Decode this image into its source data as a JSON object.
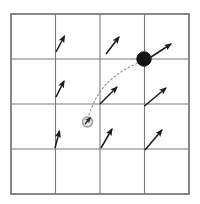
{
  "figure": {
    "background_color": "#ffffff",
    "width": 200,
    "height": 204
  },
  "grid": {
    "name": "4x4-grid",
    "rows": 4,
    "cols": 4,
    "x_lines": [
      11,
      55.5,
      100,
      144.5,
      189
    ],
    "y_lines": [
      14,
      59,
      104,
      149,
      194
    ],
    "line_color": "#7a7a7a",
    "border_color": "#6a6a6a",
    "line_width": 1.1,
    "border_width": 1.6
  },
  "chart_data": {
    "type": "scatter",
    "xlabel": "",
    "ylabel": "",
    "xlim": [
      11,
      189
    ],
    "ylim": [
      14,
      194
    ],
    "grid": true,
    "legend": "none"
  },
  "arrows": {
    "color": "#1a1a1a",
    "stroke_width": 1.5,
    "head_length": 5.2,
    "head_width": 3.4,
    "items": [
      {
        "name": "arrow-r1c2",
        "x1": 56.0,
        "y1": 52.0,
        "x2": 64.5,
        "y2": 36.0
      },
      {
        "name": "arrow-r1c3",
        "x1": 106.0,
        "y1": 54.0,
        "x2": 119.0,
        "y2": 37.0
      },
      {
        "name": "arrow-r1c4",
        "x1": 151.0,
        "y1": 57.0,
        "x2": 171.0,
        "y2": 44.0
      },
      {
        "name": "arrow-r2c2",
        "x1": 56.0,
        "y1": 97.0,
        "x2": 64.0,
        "y2": 81.0
      },
      {
        "name": "arrow-r2c3",
        "x1": 100.0,
        "y1": 104.0,
        "x2": 117.0,
        "y2": 87.0
      },
      {
        "name": "arrow-r2c4",
        "x1": 144.5,
        "y1": 106.0,
        "x2": 166.0,
        "y2": 88.0
      },
      {
        "name": "arrow-r3c2",
        "x1": 55.0,
        "y1": 148.0,
        "x2": 59.5,
        "y2": 131.0
      },
      {
        "name": "arrow-r3c3",
        "x1": 101.0,
        "y1": 148.0,
        "x2": 112.0,
        "y2": 129.0
      },
      {
        "name": "arrow-r3c4",
        "x1": 145.0,
        "y1": 150.0,
        "x2": 162.0,
        "y2": 130.0
      }
    ]
  },
  "trajectory": {
    "name": "dotted-trajectory-path",
    "from": {
      "x": 88.0,
      "y": 119.0
    },
    "to": {
      "x": 141.0,
      "y": 62.0
    },
    "control": {
      "x": 98.0,
      "y": 78.0
    },
    "color": "#8a8a8a",
    "dash_pattern": "1.6 2.6",
    "stroke_width": 1.1
  },
  "markers": {
    "goal_marker": {
      "name": "goal-marker-filled-dot",
      "x": 144.0,
      "y": 59.0,
      "radius": 7.2,
      "fill": "#151515",
      "stroke": "#151515",
      "label": "goal"
    },
    "start_marker": {
      "name": "start-marker-open-circle",
      "x": 87.5,
      "y": 122.0,
      "radius": 5.0,
      "fill": "#e3e3e3",
      "stroke": "#9b9b9b",
      "stroke_width": 1.4,
      "label": "start"
    },
    "start_arrow": {
      "name": "start-heading-arrow",
      "x1": 85.0,
      "y1": 124.0,
      "x2": 90.5,
      "y2": 117.5,
      "color": "#2a2a2a",
      "stroke_width": 1.3
    }
  }
}
